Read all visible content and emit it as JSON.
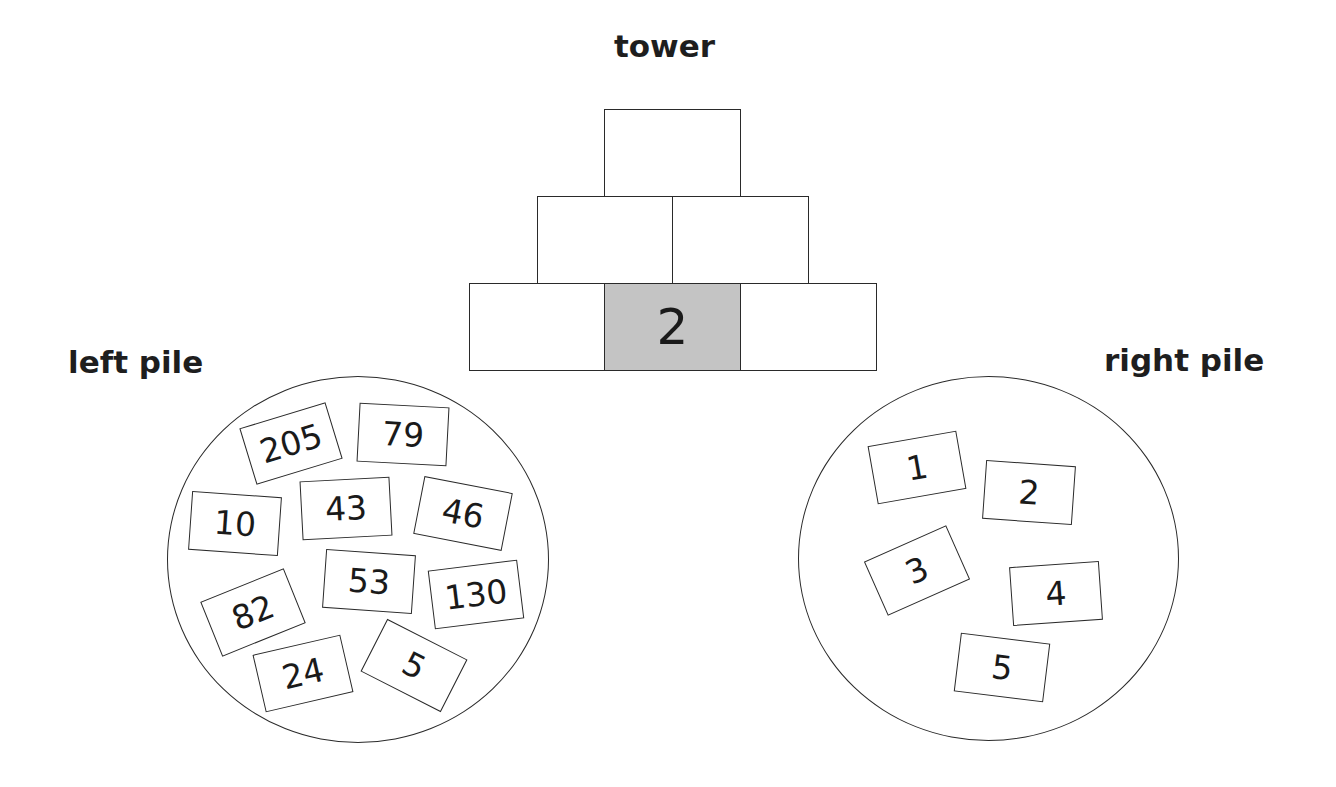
{
  "labels": {
    "tower": "tower",
    "left_pile": "left pile",
    "right_pile": "right pile"
  },
  "tower": {
    "rows": [
      {
        "row": "top",
        "bricks": [
          {
            "value": "",
            "filled": false
          }
        ]
      },
      {
        "row": "middle",
        "bricks": [
          {
            "value": "",
            "filled": false
          },
          {
            "value": "",
            "filled": false
          }
        ]
      },
      {
        "row": "bottom",
        "bricks": [
          {
            "value": "",
            "filled": false
          },
          {
            "value": "2",
            "filled": true
          },
          {
            "value": "",
            "filled": false
          }
        ]
      }
    ]
  },
  "left_pile": {
    "cards": [
      {
        "value": "205",
        "cx": 291,
        "cy": 443,
        "rot": -17
      },
      {
        "value": "79",
        "cx": 403,
        "cy": 434,
        "rot": 3
      },
      {
        "value": "10",
        "cx": 235,
        "cy": 523,
        "rot": 4
      },
      {
        "value": "43",
        "cx": 346,
        "cy": 508,
        "rot": -3
      },
      {
        "value": "46",
        "cx": 463,
        "cy": 513,
        "rot": 11
      },
      {
        "value": "53",
        "cx": 369,
        "cy": 581,
        "rot": 4
      },
      {
        "value": "130",
        "cx": 476,
        "cy": 594,
        "rot": -7
      },
      {
        "value": "82",
        "cx": 253,
        "cy": 612,
        "rot": -22
      },
      {
        "value": "24",
        "cx": 303,
        "cy": 673,
        "rot": -13
      },
      {
        "value": "5",
        "cx": 414,
        "cy": 665,
        "rot": 27
      }
    ]
  },
  "right_pile": {
    "cards": [
      {
        "value": "1",
        "cx": 917,
        "cy": 467,
        "rot": -10
      },
      {
        "value": "2",
        "cx": 1029,
        "cy": 492,
        "rot": 4
      },
      {
        "value": "3",
        "cx": 917,
        "cy": 570,
        "rot": -24
      },
      {
        "value": "4",
        "cx": 1056,
        "cy": 593,
        "rot": -4
      },
      {
        "value": "5",
        "cx": 1002,
        "cy": 667,
        "rot": 7
      }
    ]
  },
  "colors": {
    "filled_brick": "#c4c4c4",
    "stroke": "#2a2a2a",
    "background": "#ffffff"
  }
}
